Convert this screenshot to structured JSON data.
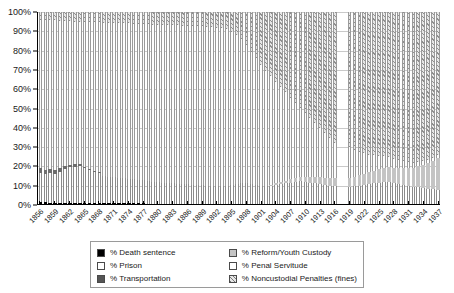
{
  "chart_data": {
    "type": "bar",
    "subtype": "stacked-100-percent",
    "title": "",
    "xlabel": "",
    "ylabel": "",
    "ylim": [
      0,
      100
    ],
    "ytick_labels": [
      "0%",
      "10%",
      "20%",
      "30%",
      "40%",
      "50%",
      "60%",
      "70%",
      "80%",
      "90%",
      "100%"
    ],
    "ytick_values": [
      0,
      10,
      20,
      30,
      40,
      50,
      60,
      70,
      80,
      90,
      100
    ],
    "grid": true,
    "legend_position": "bottom",
    "xtick_step": 3,
    "xtick_labels": [
      "1856",
      "1859",
      "1862",
      "1865",
      "1868",
      "1871",
      "1874",
      "1877",
      "1880",
      "1883",
      "1886",
      "1889",
      "1892",
      "1895",
      "1898",
      "1901",
      "1904",
      "1907",
      "1910",
      "1913",
      "1916",
      "1919",
      "1922",
      "1925",
      "1928",
      "1931",
      "1934",
      "1937"
    ],
    "categories": [
      1856,
      1857,
      1858,
      1859,
      1860,
      1861,
      1862,
      1863,
      1864,
      1865,
      1866,
      1867,
      1868,
      1869,
      1870,
      1871,
      1872,
      1873,
      1874,
      1875,
      1876,
      1877,
      1878,
      1879,
      1880,
      1881,
      1882,
      1883,
      1884,
      1885,
      1886,
      1887,
      1888,
      1889,
      1890,
      1891,
      1892,
      1893,
      1894,
      1895,
      1896,
      1897,
      1898,
      1899,
      1900,
      1901,
      1902,
      1903,
      1904,
      1905,
      1906,
      1907,
      1908,
      1909,
      1910,
      1911,
      1912,
      1913,
      1914,
      1915,
      1916,
      1917,
      1918,
      1919,
      1920,
      1921,
      1922,
      1923,
      1924,
      1925,
      1926,
      1927,
      1928,
      1929,
      1930,
      1931,
      1932,
      1933,
      1934,
      1935,
      1936,
      1937
    ],
    "missing_categories": [
      1917,
      1918
    ],
    "series": [
      {
        "name": "% Death sentence",
        "key": "death",
        "color": "#000000",
        "pattern": "solid",
        "values": [
          0.9,
          0.8,
          0.7,
          0.7,
          0.6,
          0.6,
          0.5,
          0.5,
          0.5,
          0.4,
          0.4,
          0.4,
          0.4,
          0.3,
          0.3,
          0.3,
          0.3,
          0.3,
          0.3,
          0.3,
          0.3,
          0.3,
          0.2,
          0.2,
          0.2,
          0.2,
          0.2,
          0.2,
          0.2,
          0.2,
          0.2,
          0.2,
          0.2,
          0.2,
          0.2,
          0.2,
          0.2,
          0.2,
          0.2,
          0.2,
          0.2,
          0.2,
          0.2,
          0.2,
          0.2,
          0.2,
          0.2,
          0.2,
          0.2,
          0.2,
          0.2,
          0.2,
          0.2,
          0.2,
          0.2,
          0.2,
          0.2,
          0.2,
          0.2,
          0.2,
          0.2,
          null,
          null,
          0.2,
          0.2,
          0.2,
          0.2,
          0.2,
          0.2,
          0.2,
          0.2,
          0.2,
          0.2,
          0.2,
          0.2,
          0.2,
          0.2,
          0.2,
          0.2,
          0.2,
          0.2,
          0.2
        ]
      },
      {
        "name": "% Prison",
        "key": "prison",
        "color": "#ffffff",
        "pattern": "empty",
        "values": [
          15.1,
          14.6,
          15.3,
          14.8,
          16.2,
          17.4,
          18.6,
          19.0,
          19.3,
          18.2,
          17.1,
          16.4,
          15.8,
          14.2,
          13.8,
          13.6,
          13.3,
          13.0,
          12.7,
          12.5,
          12.3,
          12.1,
          11.8,
          11.5,
          11.2,
          11.0,
          10.8,
          10.6,
          10.4,
          10.2,
          10.0,
          9.8,
          9.6,
          9.5,
          9.4,
          9.3,
          9.2,
          9.1,
          9.0,
          9.6,
          10.3,
          11.0,
          10.6,
          10.2,
          9.8,
          9.4,
          9.0,
          9.4,
          9.8,
          10.2,
          10.6,
          11.0,
          11.4,
          11.8,
          11.4,
          11.0,
          10.6,
          10.2,
          9.8,
          9.4,
          9.0,
          null,
          null,
          8.6,
          9.0,
          9.4,
          9.8,
          10.2,
          10.6,
          11.0,
          11.4,
          11.0,
          10.6,
          10.2,
          9.8,
          9.4,
          9.0,
          8.6,
          8.2,
          7.8,
          7.4,
          7.0
        ]
      },
      {
        "name": "% Transportation",
        "key": "transport",
        "color": "#6e6e6e",
        "pattern": "solid",
        "values": [
          2.6,
          2.4,
          2.2,
          2.0,
          1.8,
          1.6,
          1.4,
          1.2,
          1.0,
          0.8,
          0.6,
          0.4,
          0.3,
          0.2,
          0.1,
          0.1,
          0,
          0,
          0,
          0,
          0,
          0,
          0,
          0,
          0,
          0,
          0,
          0,
          0,
          0,
          0,
          0,
          0,
          0,
          0,
          0,
          0,
          0,
          0,
          0,
          0,
          0,
          0,
          0,
          0,
          0,
          0,
          0,
          0,
          0,
          0,
          0,
          0,
          0,
          0,
          0,
          0,
          0,
          0,
          0,
          0,
          null,
          null,
          0,
          0,
          0,
          0,
          0,
          0,
          0,
          0,
          0,
          0,
          0,
          0,
          0,
          0,
          0,
          0,
          0,
          0,
          0
        ]
      },
      {
        "name": "% Reform/Youth Custody",
        "key": "reform",
        "color": "#c4c4c4",
        "pattern": "solid",
        "values": [
          0,
          0,
          0,
          0,
          0,
          0,
          0,
          0,
          0,
          0,
          0,
          0,
          0,
          0,
          0,
          0,
          0,
          0,
          0,
          0,
          0,
          0,
          0,
          0,
          0,
          0,
          0,
          0,
          0,
          0,
          0,
          0,
          0,
          0,
          0,
          0,
          0,
          0,
          0,
          0,
          0,
          0,
          0,
          0,
          0,
          0,
          0,
          0.5,
          0.8,
          1.1,
          1.4,
          1.7,
          2.0,
          2.3,
          2.6,
          2.9,
          3.2,
          3.5,
          3.8,
          4.1,
          4.4,
          null,
          null,
          4.7,
          5.0,
          5.4,
          5.8,
          6.2,
          6.6,
          7.0,
          7.4,
          7.8,
          8.2,
          8.6,
          9.0,
          9.5,
          10.0,
          11.0,
          12.0,
          13.5,
          15.0,
          17.0
        ]
      },
      {
        "name": "% Penal Servitude",
        "key": "penal",
        "color": "#fdfdfd",
        "pattern": "empty",
        "values": [
          77.4,
          77.9,
          77.8,
          78.2,
          76.9,
          75.6,
          74.6,
          74.3,
          74.2,
          75.5,
          76.8,
          77.6,
          78.2,
          79.8,
          80.3,
          80.5,
          80.7,
          80.9,
          81.1,
          81.2,
          81.3,
          81.4,
          81.6,
          81.8,
          82.0,
          82.1,
          82.2,
          82.3,
          82.4,
          82.5,
          82.6,
          82.7,
          82.8,
          82.8,
          82.8,
          82.7,
          82.5,
          82.2,
          81.8,
          80.0,
          77.5,
          75.0,
          72.0,
          69.0,
          66.0,
          63.0,
          60.0,
          56.5,
          53.0,
          49.5,
          46.0,
          42.5,
          39.0,
          35.5,
          33.0,
          30.5,
          28.0,
          25.5,
          23.0,
          20.5,
          18.0,
          null,
          null,
          16.0,
          14.0,
          12.0,
          10.5,
          9.0,
          8.0,
          7.0,
          6.0,
          5.2,
          4.6,
          4.0,
          3.5,
          3.0,
          2.6,
          2.2,
          1.9,
          1.6,
          1.4,
          1.2
        ]
      },
      {
        "name": "% Noncustodial Penalties (fines)",
        "key": "fines",
        "color": "#e6e6e6",
        "pattern": "hatch-diagonal",
        "values": [
          4.0,
          4.3,
          4.0,
          4.3,
          4.5,
          4.8,
          4.9,
          5.0,
          5.0,
          5.1,
          5.1,
          5.2,
          5.3,
          5.5,
          5.5,
          5.5,
          5.7,
          5.8,
          5.9,
          6.0,
          6.1,
          6.2,
          6.4,
          6.5,
          6.6,
          6.7,
          6.8,
          6.9,
          7.0,
          7.1,
          7.2,
          7.3,
          7.4,
          7.5,
          7.6,
          7.8,
          8.1,
          8.5,
          9.0,
          10.2,
          12.0,
          13.8,
          17.2,
          20.6,
          24.0,
          27.4,
          30.8,
          33.4,
          36.2,
          39.0,
          41.8,
          44.6,
          47.4,
          50.2,
          52.8,
          55.4,
          58.0,
          60.6,
          63.2,
          65.8,
          68.4,
          null,
          null,
          70.5,
          71.8,
          73.0,
          73.3,
          74.4,
          74.6,
          74.8,
          74.9,
          75.4,
          76.4,
          77.4,
          78.3,
          78.9,
          79.2,
          79.0,
          78.1,
          77.4,
          76.0,
          74.6
        ]
      }
    ]
  },
  "legend": {
    "items": [
      {
        "label": "% Death sentence",
        "swatch": "sw-death",
        "name": "legend-swatch-death-sentence"
      },
      {
        "label": "% Reform/Youth Custody",
        "swatch": "sw-reform",
        "name": "legend-swatch-reform-youth-custody"
      },
      {
        "label": "% Prison",
        "swatch": "sw-prison",
        "name": "legend-swatch-prison"
      },
      {
        "label": "% Penal Servitude",
        "swatch": "sw-penal",
        "name": "legend-swatch-penal-servitude"
      },
      {
        "label": "% Transportation",
        "swatch": "sw-transport",
        "name": "legend-swatch-transportation"
      },
      {
        "label": "% Noncustodial Penalties (fines)",
        "swatch": "sw-fines",
        "name": "legend-swatch-noncustodial-penalties"
      }
    ]
  }
}
